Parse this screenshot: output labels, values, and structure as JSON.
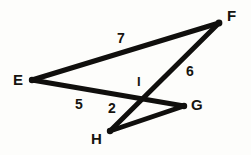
{
  "figure": {
    "background_color": "#fdfdfb",
    "stroke_color": "#100f0d",
    "vertices": [
      {
        "id": "E",
        "label": "E",
        "x": 32,
        "y": 80,
        "label_x": 13,
        "label_y": 72
      },
      {
        "id": "F",
        "label": "F",
        "x": 219,
        "y": 23,
        "label_x": 227,
        "label_y": 8
      },
      {
        "id": "G",
        "label": "G",
        "x": 184,
        "y": 106,
        "label_x": 191,
        "label_y": 97
      },
      {
        "id": "H",
        "label": "H",
        "x": 110,
        "y": 131,
        "label_x": 91,
        "label_y": 131
      },
      {
        "id": "I",
        "label": "I",
        "x": 143,
        "y": 99,
        "label_x": 137,
        "label_y": 75
      }
    ],
    "segments": [
      {
        "id": "EF",
        "from": "E",
        "to": "F",
        "x1": 32,
        "y1": 80,
        "x2": 219,
        "y2": 23,
        "width": 5.0
      },
      {
        "id": "EG",
        "from": "E",
        "to": "G",
        "x1": 32,
        "y1": 80,
        "x2": 184,
        "y2": 106,
        "width": 5.0
      },
      {
        "id": "HF",
        "from": "H",
        "to": "F",
        "x1": 110,
        "y1": 131,
        "x2": 219,
        "y2": 23,
        "width": 5.0
      },
      {
        "id": "HG",
        "from": "H",
        "to": "G",
        "x1": 110,
        "y1": 131,
        "x2": 184,
        "y2": 106,
        "width": 5.0
      }
    ],
    "measures": [
      {
        "id": "m7",
        "label": "7",
        "x": 117,
        "y": 31,
        "on_segment": "EF"
      },
      {
        "id": "m6",
        "label": "6",
        "x": 186,
        "y": 64,
        "on_segment": "HF"
      },
      {
        "id": "m5",
        "label": "5",
        "x": 75,
        "y": 97,
        "on_segment": "EG"
      },
      {
        "id": "m2",
        "label": "2",
        "x": 108,
        "y": 101,
        "on_segment": "HI"
      }
    ]
  }
}
